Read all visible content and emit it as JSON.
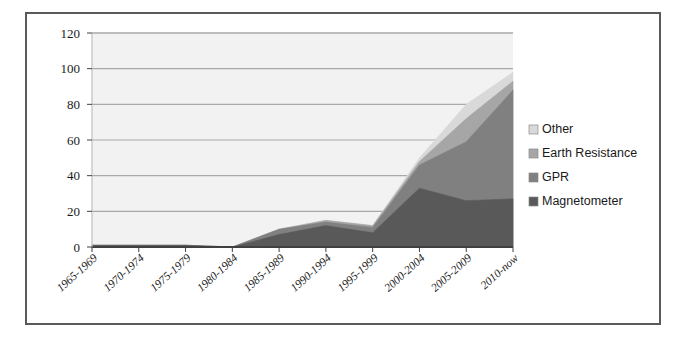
{
  "chart_data": {
    "type": "area",
    "stacked": true,
    "title": "",
    "xlabel": "",
    "ylabel": "",
    "ylim": [
      0,
      120
    ],
    "yticks": [
      0,
      20,
      40,
      60,
      80,
      100,
      120
    ],
    "grid": true,
    "legend_position": "right",
    "categories": [
      "1965-1969",
      "1970-1974",
      "1975-1979",
      "1980-1984",
      "1985-1989",
      "1990-1994",
      "1995-1999",
      "2000-2004",
      "2005-2009",
      "2010-now"
    ],
    "series": [
      {
        "name": "Magnetometer",
        "color": "#595959",
        "values": [
          1,
          1,
          1,
          0,
          7,
          12,
          8,
          33,
          26,
          27
        ]
      },
      {
        "name": "GPR",
        "color": "#808080",
        "values": [
          0,
          0,
          0,
          0,
          3,
          2,
          3,
          13,
          33,
          61
        ]
      },
      {
        "name": "Earth Resistance",
        "color": "#a6a6a6",
        "values": [
          0,
          0,
          0,
          0,
          0,
          1,
          1,
          2,
          13,
          5
        ]
      },
      {
        "name": "Other",
        "color": "#d9d9d9",
        "values": [
          0,
          0,
          0,
          0,
          0,
          0,
          0,
          2,
          8,
          5
        ]
      }
    ],
    "legend_order_top_to_bottom": [
      "Other",
      "Earth Resistance",
      "GPR",
      "Magnetometer"
    ],
    "totals": [
      1,
      1,
      1,
      0,
      10,
      15,
      12,
      50,
      80,
      98
    ]
  },
  "style": {
    "plot_background": "#f2f2f2",
    "grid_color": "#a9a9a9",
    "axis_color": "#404040",
    "frame_border": "#5a5a5a",
    "page_background": "#ffffff"
  }
}
